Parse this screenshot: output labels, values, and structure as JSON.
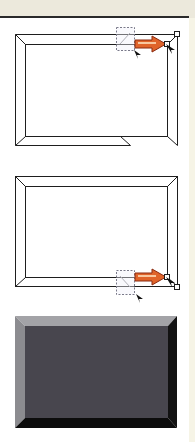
{
  "figure": {
    "panels": [
      {
        "id": "frame-top-handle-drag",
        "description": "Wireframe bevelled frame; top-right corner handle dragged outward to the right",
        "outer": {
          "x": 15,
          "y": 34,
          "w": 162,
          "h": 111
        },
        "bevel": 10,
        "selection_box": {
          "x": 116,
          "y": 27,
          "w": 18,
          "h": 23
        },
        "arrow_direction": "right",
        "handles": [
          {
            "x": 167,
            "y": 44
          },
          {
            "x": 177,
            "y": 34
          }
        ]
      },
      {
        "id": "frame-bottom-handle-drag",
        "description": "Wireframe bevelled frame; bottom-right corner handle dragged outward to the right",
        "outer": {
          "x": 15,
          "y": 176,
          "w": 162,
          "h": 110
        },
        "bevel": 10,
        "selection_box": {
          "x": 116,
          "y": 270,
          "w": 18,
          "h": 24
        },
        "arrow_direction": "right",
        "handles": [
          {
            "x": 167,
            "y": 277
          },
          {
            "x": 177,
            "y": 287
          }
        ]
      },
      {
        "id": "frame-rendered-bevel",
        "description": "Rendered bevelled frame with shading",
        "outer": {
          "x": 15,
          "y": 316,
          "w": 162,
          "h": 112
        },
        "bevel": 10
      }
    ],
    "colors": {
      "line": "#1e1e1e",
      "dashed_box": "#7a7a8a",
      "arrow_fill": "#e0642a",
      "arrow_highlight": "#f8c8a0",
      "arrow_outline": "#8a2a10",
      "bevel_top": "#a3a3a7",
      "bevel_left": "#8c8c90",
      "bevel_right": "#121212",
      "bevel_bottom": "#0c0c0c",
      "face": "#48464e",
      "topbar": "#ece9dc",
      "strip": "#f6f4e6"
    }
  }
}
